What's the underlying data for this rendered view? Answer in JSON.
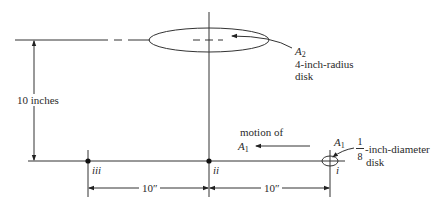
{
  "diagram": {
    "type": "geometry-setup",
    "colors": {
      "line": "#333333",
      "background": "#ffffff"
    },
    "labels": {
      "height_dimension": "10 inches",
      "a2_name": "A",
      "a2_sub": "2",
      "a2_desc": "4-inch-radius",
      "a2_desc2": "disk",
      "motion_line1": "motion of",
      "motion_a": "A",
      "motion_sub": "1",
      "a1_name": "A",
      "a1_sub": "1",
      "a1_frac_num": "1",
      "a1_frac_den": "8",
      "a1_desc": "-inch-diameter",
      "a1_desc2": "disk",
      "point_i": "i",
      "point_ii": "ii",
      "point_iii": "iii",
      "dim_left": "10″",
      "dim_right": "10″"
    }
  }
}
